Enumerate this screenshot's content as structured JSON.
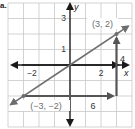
{
  "figure": {
    "label": "a.",
    "grid": {
      "color": "#c8c8c8",
      "spacing_px": 15.5,
      "x_range": [
        -4,
        4
      ],
      "y_range": [
        -4,
        4
      ]
    },
    "axes": {
      "color": "#1a1a1a",
      "x_label": "x",
      "y_label": "y",
      "x_ticks": [
        {
          "value": -2,
          "label": "−2"
        },
        {
          "value": 2,
          "label": "2"
        }
      ],
      "y_ticks": [
        {
          "value": 1,
          "label": "1"
        },
        {
          "value": 3,
          "label": "3"
        }
      ]
    },
    "line": {
      "color": "#6e6e6e",
      "slope_text": "2/3",
      "points": [
        {
          "x": -3,
          "y": -2,
          "label": "(−3, −2)"
        },
        {
          "x": 3,
          "y": 2,
          "label": "(3, 2)"
        }
      ]
    },
    "slope_triangle": {
      "color": "#555555",
      "run": {
        "value": 6,
        "label": "6"
      },
      "rise": {
        "value": 4,
        "label": "4"
      }
    }
  }
}
